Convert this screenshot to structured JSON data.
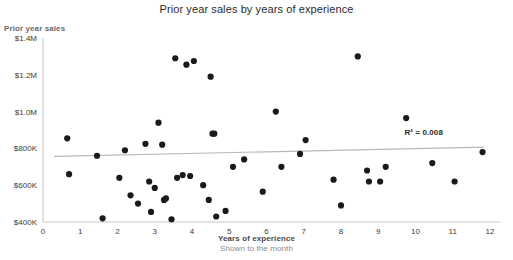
{
  "chart_data": {
    "type": "scatter",
    "title": "Prior year sales by years of experience",
    "xlabel": "Years of experience",
    "xsublabel": "Shown to the month",
    "ylabel": "Prior year sales",
    "xlim": [
      0,
      12
    ],
    "ylim": [
      400000,
      1400000
    ],
    "grid": false,
    "legend": false,
    "x_ticks": [
      0,
      1,
      2,
      3,
      4,
      5,
      6,
      7,
      8,
      9,
      10,
      11,
      12
    ],
    "x_tick_labels": [
      "0",
      "1",
      "2",
      "3",
      "4",
      "5",
      "6",
      "7",
      "8",
      "9",
      "10",
      "11",
      "12"
    ],
    "y_ticks": [
      400000,
      600000,
      800000,
      1000000,
      1200000,
      1400000
    ],
    "y_tick_labels": [
      "$400K",
      "$600K",
      "$800K",
      "$1.0M",
      "$1.2M",
      "$1.4M"
    ],
    "annotations": [
      {
        "name": "r-squared",
        "text": "R² = 0.008",
        "x": 10.4,
        "y": 880000
      }
    ],
    "trendline": {
      "label": "R² = 0.008",
      "r_squared": 0.008,
      "x_start": 0.3,
      "y_start": 757000,
      "x_end": 11.85,
      "y_end": 807000
    },
    "point_color": "#1a1a1a",
    "trendline_color": "#b9b9b9",
    "points": [
      {
        "x": 0.65,
        "y": 855000
      },
      {
        "x": 0.7,
        "y": 660000
      },
      {
        "x": 1.45,
        "y": 760000
      },
      {
        "x": 1.6,
        "y": 420000
      },
      {
        "x": 2.05,
        "y": 640000
      },
      {
        "x": 2.2,
        "y": 790000
      },
      {
        "x": 2.35,
        "y": 545000
      },
      {
        "x": 2.55,
        "y": 500000
      },
      {
        "x": 2.75,
        "y": 825000
      },
      {
        "x": 2.85,
        "y": 620000
      },
      {
        "x": 2.9,
        "y": 455000
      },
      {
        "x": 3.0,
        "y": 585000
      },
      {
        "x": 3.1,
        "y": 940000
      },
      {
        "x": 3.2,
        "y": 820000
      },
      {
        "x": 3.25,
        "y": 520000
      },
      {
        "x": 3.3,
        "y": 528000
      },
      {
        "x": 3.45,
        "y": 415000
      },
      {
        "x": 3.55,
        "y": 1290000
      },
      {
        "x": 3.6,
        "y": 640000
      },
      {
        "x": 3.75,
        "y": 655000
      },
      {
        "x": 3.85,
        "y": 1255000
      },
      {
        "x": 3.95,
        "y": 650000
      },
      {
        "x": 4.05,
        "y": 1275000
      },
      {
        "x": 4.3,
        "y": 600000
      },
      {
        "x": 4.45,
        "y": 520000
      },
      {
        "x": 4.5,
        "y": 1190000
      },
      {
        "x": 4.55,
        "y": 880000
      },
      {
        "x": 4.6,
        "y": 880000
      },
      {
        "x": 4.65,
        "y": 430000
      },
      {
        "x": 4.9,
        "y": 460000
      },
      {
        "x": 5.1,
        "y": 700000
      },
      {
        "x": 5.4,
        "y": 740000
      },
      {
        "x": 5.9,
        "y": 565000
      },
      {
        "x": 6.25,
        "y": 1000000
      },
      {
        "x": 6.4,
        "y": 700000
      },
      {
        "x": 6.9,
        "y": 770000
      },
      {
        "x": 7.05,
        "y": 845000
      },
      {
        "x": 7.8,
        "y": 630000
      },
      {
        "x": 8.0,
        "y": 490000
      },
      {
        "x": 8.45,
        "y": 1300000
      },
      {
        "x": 8.7,
        "y": 680000
      },
      {
        "x": 8.75,
        "y": 620000
      },
      {
        "x": 9.05,
        "y": 620000
      },
      {
        "x": 9.2,
        "y": 700000
      },
      {
        "x": 9.75,
        "y": 965000
      },
      {
        "x": 10.45,
        "y": 720000
      },
      {
        "x": 11.05,
        "y": 620000
      },
      {
        "x": 11.8,
        "y": 780000
      }
    ]
  }
}
